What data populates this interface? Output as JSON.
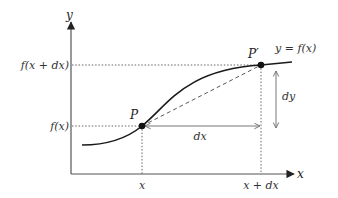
{
  "diagram": {
    "type": "derivative-secant-illustration",
    "axes": {
      "x_label": "x",
      "y_label": "y"
    },
    "curve_label": "y = f(x)",
    "points": [
      {
        "id": "P",
        "label": "P"
      },
      {
        "id": "P_prime",
        "label": "P′"
      }
    ],
    "x_ticks": [
      "x",
      "x + dx"
    ],
    "y_ticks": [
      "f(x)",
      "f(x + dx)"
    ],
    "increments": {
      "dx_label": "dx",
      "dy_label": "dy"
    },
    "colors": {
      "curve": "#1a1a1a",
      "axes": "#555555",
      "guide": "#555555",
      "arrows": "#777777"
    }
  }
}
